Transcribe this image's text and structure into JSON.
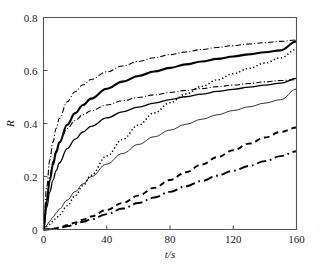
{
  "chart_data": {
    "type": "line",
    "title": "",
    "xlabel": "t/s",
    "ylabel": "R",
    "xlim": [
      0,
      160
    ],
    "ylim": [
      0,
      0.8
    ],
    "xticks": [
      "0",
      "40",
      "80",
      "120",
      "160"
    ],
    "yticks": [
      "0",
      "0.2",
      "0.4",
      "0.6",
      "0.8"
    ],
    "grid": false,
    "legend": "none",
    "x": [
      0,
      2,
      4,
      6,
      8,
      10,
      15,
      20,
      25,
      30,
      40,
      50,
      60,
      70,
      80,
      90,
      100,
      110,
      120,
      130,
      140,
      150,
      160
    ],
    "series": [
      {
        "name": "curve-1",
        "style": "dash-dot",
        "width": 1.1,
        "color": "#000000",
        "values": [
          0,
          0.16,
          0.262,
          0.331,
          0.381,
          0.419,
          0.482,
          0.52,
          0.546,
          0.566,
          0.595,
          0.617,
          0.634,
          0.648,
          0.66,
          0.67,
          0.679,
          0.687,
          0.694,
          0.7,
          0.705,
          0.71,
          0.715
        ]
      },
      {
        "name": "curve-2",
        "style": "solid",
        "width": 2.1,
        "color": "#000000",
        "values": [
          0,
          0.108,
          0.186,
          0.245,
          0.291,
          0.328,
          0.395,
          0.439,
          0.47,
          0.494,
          0.531,
          0.558,
          0.579,
          0.596,
          0.61,
          0.623,
          0.634,
          0.644,
          0.653,
          0.661,
          0.669,
          0.676,
          0.71
        ]
      },
      {
        "name": "curve-3",
        "style": "dotted",
        "width": 1.5,
        "color": "#000000",
        "values": [
          0,
          0.01,
          0.02,
          0.031,
          0.043,
          0.055,
          0.09,
          0.127,
          0.166,
          0.204,
          0.277,
          0.34,
          0.394,
          0.44,
          0.478,
          0.511,
          0.54,
          0.565,
          0.588,
          0.608,
          0.628,
          0.648,
          0.68
        ]
      },
      {
        "name": "curve-4",
        "style": "solid",
        "width": 1.3,
        "color": "#000000",
        "values": [
          0,
          0.082,
          0.141,
          0.186,
          0.222,
          0.251,
          0.305,
          0.341,
          0.368,
          0.389,
          0.421,
          0.444,
          0.462,
          0.477,
          0.49,
          0.501,
          0.511,
          0.521,
          0.529,
          0.537,
          0.545,
          0.552,
          0.57
        ]
      },
      {
        "name": "curve-5",
        "style": "dash-dot",
        "width": 1.1,
        "color": "#000000",
        "values": [
          0,
          0.12,
          0.2,
          0.256,
          0.297,
          0.329,
          0.381,
          0.412,
          0.433,
          0.448,
          0.47,
          0.486,
          0.498,
          0.508,
          0.517,
          0.525,
          0.532,
          0.539,
          0.545,
          0.551,
          0.557,
          0.562,
          0.565
        ]
      },
      {
        "name": "curve-6",
        "style": "solid",
        "width": 0.8,
        "color": "#777777",
        "values": [
          0,
          0.016,
          0.032,
          0.047,
          0.062,
          0.077,
          0.111,
          0.143,
          0.172,
          0.199,
          0.247,
          0.287,
          0.321,
          0.35,
          0.375,
          0.397,
          0.416,
          0.433,
          0.449,
          0.463,
          0.477,
          0.49,
          0.53
        ]
      },
      {
        "name": "curve-7",
        "style": "dashed",
        "width": 1.9,
        "color": "#000000",
        "values": [
          0,
          0.0004,
          0.0015,
          0.003,
          0.005,
          0.008,
          0.016,
          0.026,
          0.037,
          0.049,
          0.074,
          0.1,
          0.128,
          0.157,
          0.187,
          0.216,
          0.245,
          0.273,
          0.299,
          0.324,
          0.347,
          0.368,
          0.385
        ]
      },
      {
        "name": "curve-8",
        "style": "dash-dot",
        "width": 1.9,
        "color": "#000000",
        "values": [
          0,
          0.0003,
          0.001,
          0.002,
          0.004,
          0.006,
          0.012,
          0.02,
          0.029,
          0.038,
          0.058,
          0.079,
          0.1,
          0.121,
          0.142,
          0.163,
          0.183,
          0.203,
          0.222,
          0.24,
          0.258,
          0.277,
          0.295
        ]
      }
    ]
  },
  "axes": {
    "x_title": "t/s",
    "x_title_italic": "t",
    "x_title_rest": "/s",
    "y_title": "R"
  }
}
